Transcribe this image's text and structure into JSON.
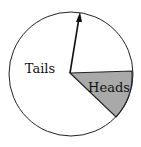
{
  "diagram": {
    "type": "spinner",
    "regions": [
      {
        "label": "Tails",
        "fill": "#ffffff"
      },
      {
        "label": "Heads",
        "fill": "#a9a9a9"
      }
    ],
    "colors": {
      "outline": "#222222",
      "heads_fill": "#a9a9a9",
      "background": "#ffffff"
    }
  }
}
